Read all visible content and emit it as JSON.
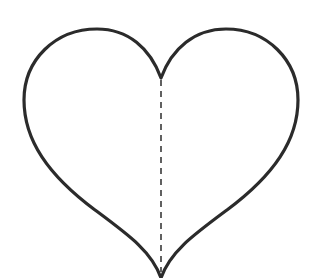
{
  "figure": {
    "shape": "heart",
    "outline_color": "#2b2b2b",
    "fold_line": "dashed vertical center line",
    "fold_line_color": "#3a3a3a",
    "background": "#ffffff"
  }
}
